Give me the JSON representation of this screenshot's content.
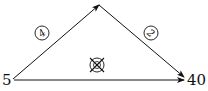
{
  "diagram": {
    "nodes": [
      {
        "id": "left",
        "label": "5"
      },
      {
        "id": "right",
        "label": "40"
      }
    ],
    "edges": [
      {
        "id": "left-to-apex",
        "from": "left",
        "to": "apex",
        "label": "4"
      },
      {
        "id": "apex-to-right",
        "from": "apex",
        "to": "right",
        "label": "2"
      },
      {
        "id": "left-to-right",
        "from": "left",
        "to": "right",
        "label": "",
        "crossed_symbol": true
      }
    ],
    "colors": {
      "line": "#111111",
      "background": "#ffffff"
    }
  }
}
